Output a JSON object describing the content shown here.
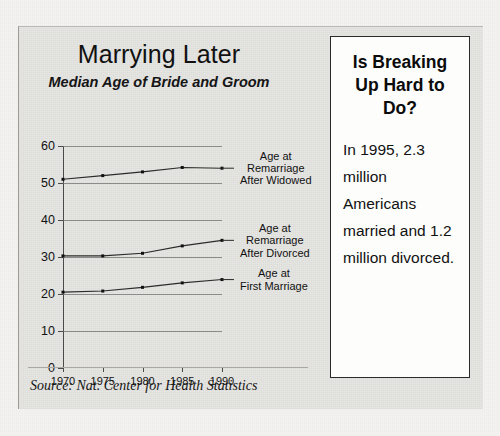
{
  "figure": {
    "title": "Marrying Later",
    "subtitle": "Median Age of Bride and Groom",
    "source": "Source: Nat. Center for Health Statistics"
  },
  "sidebar": {
    "heading": "Is Breaking Up Hard to Do?",
    "body": "In 1995, 2.3 million Americans married and 1.2 million divorced."
  },
  "chart_data": {
    "type": "line",
    "title": "Marrying Later",
    "subtitle": "Median Age of Bride and Groom",
    "xlabel": "",
    "ylabel": "",
    "x": [
      1970,
      1975,
      1980,
      1985,
      1990
    ],
    "categories": [
      "1970",
      "1975",
      "1980",
      "1985",
      "1990"
    ],
    "ylim": [
      0,
      60
    ],
    "yticks": [
      0,
      10,
      20,
      30,
      40,
      50,
      60
    ],
    "ytick_labels": [
      "0",
      "10",
      "20",
      "30",
      "40",
      "50",
      "60"
    ],
    "xlim": [
      1970,
      1990
    ],
    "grid": true,
    "legend": "right-callouts",
    "series": [
      {
        "name": "Age at Remarriage After Widowed",
        "values": [
          51,
          52,
          53,
          54.2,
          54
        ],
        "label_lines": [
          "Age at",
          "Remarriage",
          "After Widowed"
        ]
      },
      {
        "name": "Age at Remarriage After Divorced",
        "values": [
          30.3,
          30.3,
          31,
          33,
          34.5
        ],
        "label_lines": [
          "Age at",
          "Remarriage",
          "After Divorced"
        ]
      },
      {
        "name": "Age at First Marriage",
        "values": [
          20.5,
          20.8,
          21.8,
          23,
          23.9
        ],
        "label_lines": [
          "Age at",
          "First Marriage"
        ]
      }
    ],
    "source": "Source: Nat. Center for Health Statistics"
  }
}
